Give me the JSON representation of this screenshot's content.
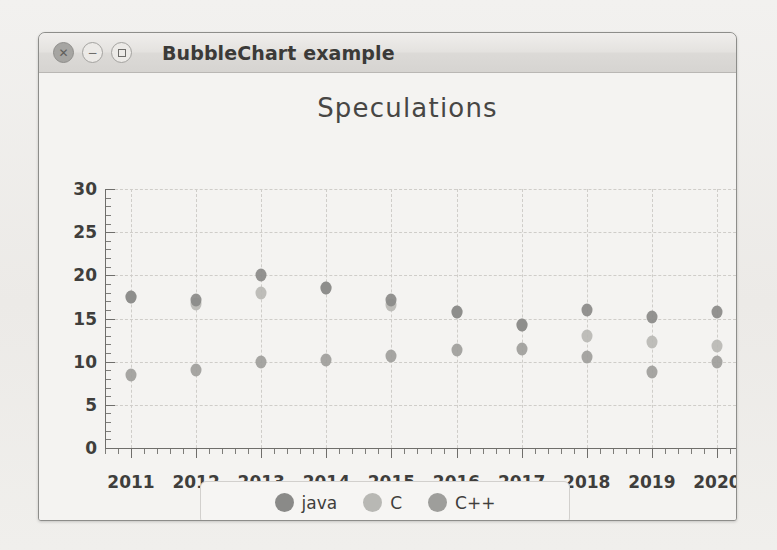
{
  "window": {
    "title": "BubbleChart example",
    "controls": [
      {
        "name": "close",
        "glyph": "✕"
      },
      {
        "name": "minimize",
        "glyph": "−"
      },
      {
        "name": "maximize",
        "glyph": "□"
      }
    ]
  },
  "colors": {
    "java": "#8a8a88",
    "c": "#b8b8b4",
    "cpp": "#9e9e9b",
    "axis": "#6f6e6b",
    "grid": "#cfcdc9",
    "text": "#3f3e3c",
    "window_bg": "#f4f3f1",
    "titlebar_bg": "#e0dedb"
  },
  "chart_data": {
    "type": "scatter",
    "title": "Speculations",
    "xlabel": "",
    "ylabel": "",
    "xlim": [
      2010.6,
      2020.6
    ],
    "ylim": [
      0,
      30
    ],
    "grid": true,
    "legend_position": "bottom",
    "y_ticks": [
      0,
      5,
      10,
      15,
      20,
      25,
      30
    ],
    "y_minor_step": 1,
    "categories": [
      2011,
      2012,
      2013,
      2014,
      2015,
      2016,
      2017,
      2018,
      2019,
      2020
    ],
    "x_tick_labels": [
      "2011",
      "2012",
      "2013",
      "2014",
      "2015",
      "2016",
      "2017",
      "2018",
      "2019",
      "2020"
    ],
    "series": [
      {
        "name": "java",
        "color": "#8a8a88",
        "x": [
          2011,
          2012,
          2013,
          2014,
          2015,
          2016,
          2017,
          2018,
          2019,
          2020
        ],
        "values": [
          17.5,
          17.2,
          20.0,
          18.5,
          17.2,
          15.8,
          14.3,
          16.0,
          15.2,
          15.7
        ],
        "sizes": [
          11,
          11,
          11,
          11,
          11,
          11,
          11,
          11,
          11,
          11
        ]
      },
      {
        "name": "C",
        "color": "#b8b8b4",
        "x": [
          2011,
          2012,
          2013,
          2014,
          2015,
          2016,
          2017,
          2018,
          2019,
          2020
        ],
        "values": [
          17.5,
          16.7,
          18.0,
          18.5,
          16.6,
          15.8,
          14.3,
          13.0,
          12.3,
          11.8
        ],
        "sizes": [
          11,
          11,
          11,
          11,
          11,
          11,
          11,
          11,
          11,
          11
        ]
      },
      {
        "name": "C++",
        "color": "#9e9e9b",
        "x": [
          2011,
          2012,
          2013,
          2014,
          2015,
          2016,
          2017,
          2018,
          2019,
          2020
        ],
        "values": [
          8.5,
          9.0,
          10.0,
          10.2,
          10.7,
          11.3,
          11.5,
          10.5,
          8.8,
          10.0
        ],
        "sizes": [
          11,
          11,
          11,
          11,
          11,
          11,
          11,
          11,
          11,
          11
        ]
      }
    ]
  },
  "legend": {
    "entries": [
      {
        "label": "java",
        "color": "#8a8a88"
      },
      {
        "label": "C",
        "color": "#b8b8b4"
      },
      {
        "label": "C++",
        "color": "#9e9e9b"
      }
    ]
  }
}
